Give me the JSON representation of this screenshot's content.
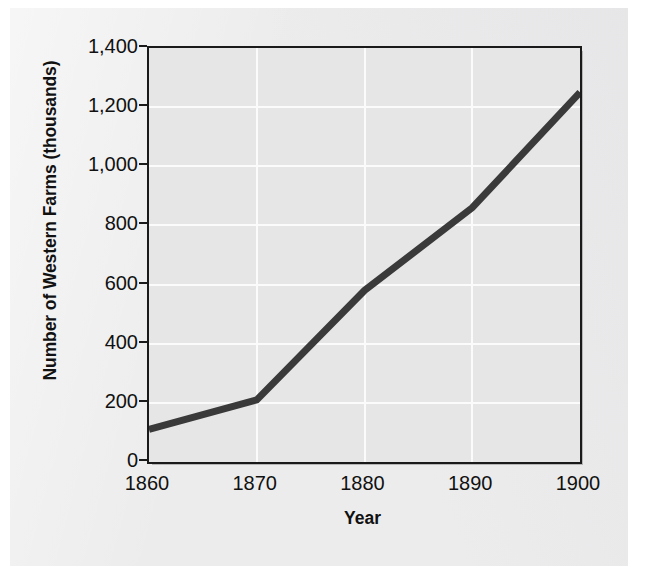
{
  "chart_data": {
    "type": "line",
    "title": "",
    "xlabel": "Year",
    "ylabel": "Number of Western Farms (thousands)",
    "x": [
      1860,
      1870,
      1880,
      1890,
      1900
    ],
    "values": [
      110,
      210,
      580,
      860,
      1250
    ],
    "series": [
      {
        "name": "Number of Western Farms",
        "values": [
          110,
          210,
          580,
          860,
          1250
        ]
      }
    ],
    "xlim": [
      1860,
      1900
    ],
    "ylim": [
      0,
      1400
    ],
    "xticks": [
      1860,
      1870,
      1880,
      1890,
      1900
    ],
    "yticks": [
      0,
      200,
      400,
      600,
      800,
      1000,
      1200,
      1400
    ],
    "xtick_labels": [
      "1860",
      "1870",
      "1880",
      "1890",
      "1900"
    ],
    "ytick_labels": [
      "0",
      "200",
      "400",
      "600",
      "800",
      "1,000",
      "1,200",
      "1,400"
    ],
    "grid": "both",
    "legend": "none",
    "line_color": "#3a3a3a",
    "plot_background": "#e6e6e7",
    "gridline_color": "#fbfbfb",
    "axis_color": "#1a1a1a"
  },
  "axes": {
    "y_title": "Number of Western Farms (thousands)",
    "x_title": "Year"
  }
}
